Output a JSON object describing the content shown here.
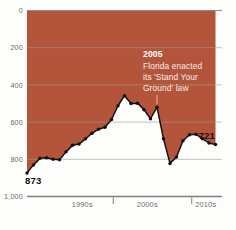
{
  "chart_data": {
    "type": "area",
    "title": "",
    "subtitle": "",
    "xlabel": "",
    "ylabel": "",
    "inverted_y": true,
    "ylim": [
      0,
      1000
    ],
    "grid": true,
    "legend_position": "none",
    "y_ticks": [
      "0",
      "200",
      "400",
      "600",
      "800",
      "1,000"
    ],
    "y_tick_values": [
      0,
      200,
      400,
      600,
      800,
      1000
    ],
    "x_ticks": [
      "1990s",
      "2000s",
      "2010s"
    ],
    "x_tick_values": [
      1993.5,
      2003.5,
      2012.5
    ],
    "x_domain": [
      1985,
      2015
    ],
    "series_name": "Florida firearm homicide rank / value",
    "x": [
      1985,
      1986,
      1987,
      1988,
      1989,
      1990,
      1991,
      1992,
      1993,
      1994,
      1995,
      1996,
      1997,
      1998,
      1999,
      2000,
      2001,
      2002,
      2003,
      2004,
      2005,
      2006,
      2007,
      2008,
      2009,
      2010,
      2011,
      2012,
      2013,
      2014
    ],
    "values": [
      873,
      830,
      795,
      792,
      800,
      803,
      760,
      725,
      718,
      690,
      660,
      638,
      628,
      586,
      512,
      458,
      500,
      498,
      533,
      582,
      520,
      690,
      822,
      788,
      700,
      668,
      665,
      690,
      712,
      721
    ],
    "first_point_label": "873",
    "last_point_label": "721",
    "area_fill_color": "#b4553b",
    "line_color": "#121212",
    "marker_color": "#121212",
    "background_color": "#fdfdfc",
    "gridline_color": "#9a9a96",
    "annotations": [
      {
        "id": "stand-your-ground",
        "head": "2005",
        "body_lines": [
          "Florida enacted",
          "its 'Stand Your",
          "Ground' law"
        ],
        "pointer_x_year": 2005,
        "text_color": "#ffffff"
      }
    ]
  }
}
